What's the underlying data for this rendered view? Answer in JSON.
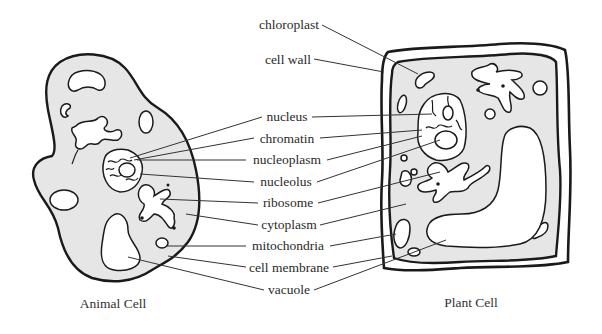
{
  "diagram": {
    "type": "labeled-biology-diagram",
    "captions": {
      "animal": "Animal Cell",
      "plant": "Plant Cell"
    },
    "labels": [
      {
        "id": "chloroplast",
        "text": "chloroplast"
      },
      {
        "id": "cell-wall",
        "text": "cell wall"
      },
      {
        "id": "nucleus",
        "text": "nucleus"
      },
      {
        "id": "chromatin",
        "text": "chromatin"
      },
      {
        "id": "nucleoplasm",
        "text": "nucleoplasm"
      },
      {
        "id": "nucleolus",
        "text": "nucleolus"
      },
      {
        "id": "ribosome",
        "text": "ribosome"
      },
      {
        "id": "cytoplasm",
        "text": "cytoplasm"
      },
      {
        "id": "mitochondria",
        "text": "mitochondria"
      },
      {
        "id": "cell-membrane",
        "text": "cell membrane"
      },
      {
        "id": "vacuole",
        "text": "vacuole"
      }
    ],
    "colors": {
      "cytoplasm_fill": "#e6e6e6",
      "outline": "#1a1a1a",
      "text": "#2a2a2a",
      "background": "#ffffff"
    }
  }
}
